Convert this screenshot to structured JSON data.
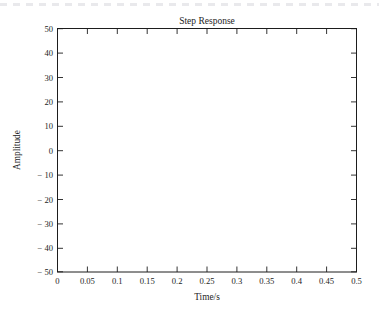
{
  "chart_data": {
    "type": "line",
    "title": "Step Response",
    "xlabel": "Time/s",
    "ylabel": "Amplitude",
    "xlim": [
      0,
      0.5
    ],
    "ylim": [
      -50,
      50
    ],
    "grid": false,
    "legend": null,
    "x_ticks": [
      "0",
      "0.05",
      "0.1",
      "0.15",
      "0.2",
      "0.25",
      "0.3",
      "0.35",
      "0.4",
      "0.45",
      "0.5"
    ],
    "x_tick_values": [
      0,
      0.05,
      0.1,
      0.15,
      0.2,
      0.25,
      0.3,
      0.35,
      0.4,
      0.45,
      0.5
    ],
    "y_ticks": [
      "50",
      "40",
      "30",
      "20",
      "10",
      "0",
      "− 10",
      "− 20",
      "− 30",
      "− 40",
      "− 50"
    ],
    "y_tick_values": [
      50,
      40,
      30,
      20,
      10,
      0,
      -10,
      -20,
      -30,
      -40,
      -50
    ],
    "series": [
      {
        "name": "step response",
        "color": "#2a2a2a",
        "description": "Growing (unstable) damped oscillation; amplitude increases exponentially from about 2 at t=0.025 to a maximum of 50 at t=0.483, then drops sharply to about -20 at t=0.5",
        "x": [
          0.0,
          0.006,
          0.012,
          0.018,
          0.024,
          0.031,
          0.037,
          0.043,
          0.049,
          0.055,
          0.061,
          0.067,
          0.073,
          0.079,
          0.085,
          0.091,
          0.097,
          0.104,
          0.11,
          0.116,
          0.122,
          0.128,
          0.134,
          0.14,
          0.146,
          0.152,
          0.158,
          0.164,
          0.17,
          0.177,
          0.183,
          0.189,
          0.195,
          0.201,
          0.207,
          0.213,
          0.219,
          0.225,
          0.231,
          0.237,
          0.243,
          0.25,
          0.256,
          0.262,
          0.268,
          0.274,
          0.28,
          0.286,
          0.292,
          0.298,
          0.304,
          0.31,
          0.316,
          0.323,
          0.329,
          0.335,
          0.341,
          0.347,
          0.353,
          0.359,
          0.365,
          0.371,
          0.377,
          0.383,
          0.389,
          0.396,
          0.402,
          0.408,
          0.414,
          0.42,
          0.426,
          0.432,
          0.438,
          0.444,
          0.45,
          0.456,
          0.462,
          0.469,
          0.475,
          0.481,
          0.487,
          0.493,
          0.5
        ],
        "y": [
          0.0,
          0.7,
          1.5,
          1.9,
          2.0,
          1.7,
          1.0,
          0.1,
          -0.6,
          -1.0,
          -1.1,
          -0.8,
          -0.1,
          0.9,
          1.8,
          2.4,
          2.5,
          2.2,
          1.4,
          0.3,
          -0.8,
          -1.5,
          -1.7,
          -1.4,
          -0.5,
          0.8,
          2.0,
          2.8,
          3.0,
          2.6,
          1.5,
          0.1,
          -1.4,
          -2.3,
          -2.6,
          -2.1,
          -0.8,
          0.9,
          2.6,
          3.8,
          4.2,
          3.6,
          2.0,
          -0.2,
          -2.4,
          -3.9,
          -4.3,
          -3.5,
          -1.6,
          1.0,
          3.6,
          5.8,
          7.0,
          6.7,
          4.8,
          1.7,
          -2.0,
          -5.2,
          -6.7,
          -6.3,
          -4.0,
          -0.2,
          4.2,
          7.9,
          10.3,
          10.1,
          7.1,
          2.2,
          -3.4,
          -8.0,
          -10.4,
          -9.7,
          -5.9,
          0.3,
          7.2,
          12.7,
          15.2,
          13.3,
          7.2,
          -1.6,
          -10.3,
          -15.8,
          -16.2
        ],
        "key_extrema": [
          {
            "t": 0.025,
            "value": 2
          },
          {
            "t": 0.078,
            "value": 2.5
          },
          {
            "t": 0.131,
            "value": 3
          },
          {
            "t": 0.183,
            "value": 4.2
          },
          {
            "t": 0.205,
            "value": -4.2
          },
          {
            "t": 0.232,
            "value": 7
          },
          {
            "t": 0.256,
            "value": -6.8
          },
          {
            "t": 0.281,
            "value": 10.3
          },
          {
            "t": 0.306,
            "value": -10.5
          },
          {
            "t": 0.331,
            "value": 15.2
          },
          {
            "t": 0.356,
            "value": -16.2
          },
          {
            "t": 0.382,
            "value": 22
          },
          {
            "t": 0.408,
            "value": -25
          },
          {
            "t": 0.433,
            "value": 33
          },
          {
            "t": 0.457,
            "value": -38.5
          },
          {
            "t": 0.483,
            "value": 50
          },
          {
            "t": 0.5,
            "value": -20
          }
        ]
      }
    ]
  }
}
